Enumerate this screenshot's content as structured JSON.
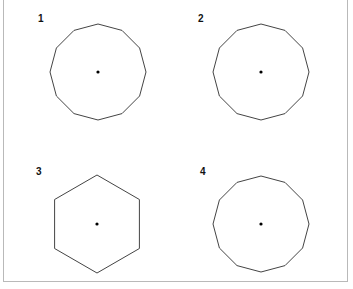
{
  "figure": {
    "panels": [
      {
        "label": "1",
        "shape": "six-pointed-star-sharp",
        "vertices": 12,
        "description": "hexagram with deep concave notches",
        "has_center_dot": true
      },
      {
        "label": "2",
        "shape": "six-pointed-star-shallow",
        "vertices": 12,
        "description": "six-pointed star with shallow concave notches",
        "has_center_dot": true
      },
      {
        "label": "3",
        "shape": "regular-hexagon",
        "vertices": 6,
        "description": "regular hexagon",
        "has_center_dot": true
      },
      {
        "label": "4",
        "shape": "regular-dodecagon",
        "vertices": 12,
        "description": "regular 12-gon",
        "has_center_dot": true
      }
    ],
    "colors": {
      "stroke": "#444444",
      "border": "#b9b9b9",
      "dot": "#000000"
    }
  }
}
